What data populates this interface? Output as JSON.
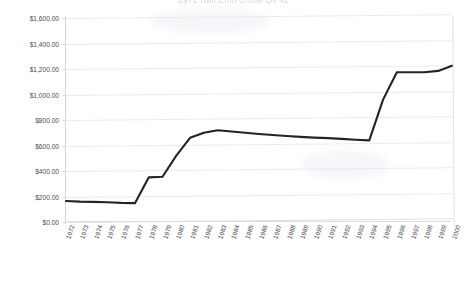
{
  "chart_data": {
    "type": "line",
    "title": "1972 Rail Emu Crude Oil 42",
    "xlabel": "",
    "ylabel": "",
    "ylim": [
      0,
      1600
    ],
    "ytick_values": [
      0,
      200,
      400,
      600,
      800,
      1000,
      1200,
      1400,
      1600
    ],
    "ytick_labels": [
      "$0.00",
      "$200.00",
      "$400.00",
      "$600.00",
      "$800.00",
      "$1,000.00",
      "$1,200.00",
      "$1,400.00",
      "$1,600.00"
    ],
    "grid": true,
    "legend": false,
    "categories": [
      "1972",
      "1973",
      "1974",
      "1975",
      "1976",
      "1977",
      "1978",
      "1979",
      "1980",
      "1981",
      "1982",
      "1983",
      "1984",
      "1985",
      "1986",
      "1987",
      "1988",
      "1989",
      "1990",
      "1991",
      "1992",
      "1993",
      "1994",
      "1995",
      "1996",
      "1997",
      "1998",
      "1999",
      "2000"
    ],
    "series": [
      {
        "name": "Crude Oil",
        "color": "#242428",
        "values": [
          165,
          160,
          158,
          155,
          150,
          148,
          350,
          355,
          520,
          660,
          700,
          720,
          710,
          700,
          690,
          682,
          675,
          668,
          662,
          658,
          652,
          645,
          640,
          960,
          1175,
          1175,
          1175,
          1185,
          1225
        ]
      }
    ]
  }
}
